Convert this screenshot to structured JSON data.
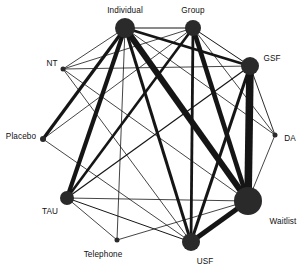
{
  "figure": {
    "type": "network-graph",
    "width": 307,
    "height": 269,
    "background_color": "#ffffff",
    "node_color": "#2a2a2a",
    "edge_color": "#151515",
    "label_color": "#101010"
  },
  "chart_data": {
    "type": "network",
    "title": "",
    "xlabel": "",
    "ylabel": "",
    "grid": false,
    "legend": "none",
    "nodes": [
      {
        "id": "Individual",
        "label": "Individual",
        "x": 125,
        "y": 28,
        "r": 10.0,
        "label_x": 125,
        "label_y": 11,
        "label_anchor": "middle"
      },
      {
        "id": "Group",
        "label": "Group",
        "x": 193,
        "y": 28,
        "r": 8.0,
        "label_x": 193,
        "label_y": 11,
        "label_anchor": "middle"
      },
      {
        "id": "GSF",
        "label": "GSF",
        "x": 250,
        "y": 66,
        "r": 9.0,
        "label_x": 272,
        "label_y": 59,
        "label_anchor": "middle"
      },
      {
        "id": "NT",
        "label": "NT",
        "x": 63,
        "y": 69,
        "r": 2.5,
        "label_x": 52,
        "label_y": 64,
        "label_anchor": "middle"
      },
      {
        "id": "Placebo",
        "label": "Placebo",
        "x": 43,
        "y": 139,
        "r": 3.0,
        "label_x": 21,
        "label_y": 137,
        "label_anchor": "middle"
      },
      {
        "id": "DA",
        "label": "DA",
        "x": 275,
        "y": 135,
        "r": 2.5,
        "label_x": 290,
        "label_y": 139,
        "label_anchor": "middle"
      },
      {
        "id": "TAU",
        "label": "TAU",
        "x": 67,
        "y": 198,
        "r": 7.0,
        "label_x": 50,
        "label_y": 212,
        "label_anchor": "middle"
      },
      {
        "id": "Waitlist",
        "label": "Waitlist",
        "x": 248,
        "y": 201,
        "r": 14.0,
        "label_x": 283,
        "label_y": 222,
        "label_anchor": "middle"
      },
      {
        "id": "USF",
        "label": "USF",
        "x": 191,
        "y": 242,
        "r": 9.0,
        "label_x": 205,
        "label_y": 262,
        "label_anchor": "middle"
      },
      {
        "id": "Telephone",
        "label": "Telephone",
        "x": 117,
        "y": 240,
        "r": 2.5,
        "label_x": 103,
        "label_y": 255,
        "label_anchor": "middle"
      }
    ],
    "edges": [
      {
        "source": "Individual",
        "target": "Group",
        "width": 1.0
      },
      {
        "source": "Individual",
        "target": "GSF",
        "width": 2.8
      },
      {
        "source": "Individual",
        "target": "NT",
        "width": 0.8
      },
      {
        "source": "Individual",
        "target": "Placebo",
        "width": 3.2
      },
      {
        "source": "Individual",
        "target": "DA",
        "width": 0.8
      },
      {
        "source": "Individual",
        "target": "TAU",
        "width": 4.2
      },
      {
        "source": "Individual",
        "target": "Waitlist",
        "width": 6.2
      },
      {
        "source": "Individual",
        "target": "USF",
        "width": 3.0
      },
      {
        "source": "Individual",
        "target": "Telephone",
        "width": 0.8
      },
      {
        "source": "Group",
        "target": "GSF",
        "width": 1.0
      },
      {
        "source": "Group",
        "target": "NT",
        "width": 0.8
      },
      {
        "source": "Group",
        "target": "Placebo",
        "width": 0.8
      },
      {
        "source": "Group",
        "target": "DA",
        "width": 0.8
      },
      {
        "source": "Group",
        "target": "TAU",
        "width": 2.6
      },
      {
        "source": "Group",
        "target": "Waitlist",
        "width": 4.6
      },
      {
        "source": "Group",
        "target": "USF",
        "width": 2.8
      },
      {
        "source": "GSF",
        "target": "NT",
        "width": 0.8
      },
      {
        "source": "GSF",
        "target": "DA",
        "width": 0.9
      },
      {
        "source": "GSF",
        "target": "TAU",
        "width": 1.2
      },
      {
        "source": "GSF",
        "target": "Waitlist",
        "width": 7.6
      },
      {
        "source": "GSF",
        "target": "USF",
        "width": 3.0
      },
      {
        "source": "NT",
        "target": "Waitlist",
        "width": 0.8
      },
      {
        "source": "NT",
        "target": "USF",
        "width": 0.8
      },
      {
        "source": "Placebo",
        "target": "USF",
        "width": 0.8
      },
      {
        "source": "DA",
        "target": "Waitlist",
        "width": 0.8
      },
      {
        "source": "TAU",
        "target": "Waitlist",
        "width": 0.8
      },
      {
        "source": "TAU",
        "target": "USF",
        "width": 1.0
      },
      {
        "source": "TAU",
        "target": "Telephone",
        "width": 0.8
      },
      {
        "source": "Waitlist",
        "target": "USF",
        "width": 5.0
      },
      {
        "source": "Waitlist",
        "target": "Telephone",
        "width": 0.8
      }
    ]
  }
}
